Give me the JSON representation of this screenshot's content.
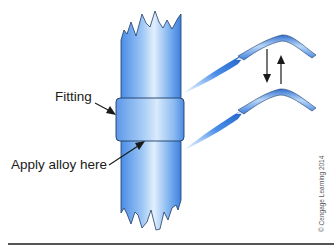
{
  "figure": {
    "labels": {
      "fitting": "Fitting",
      "apply_alloy": "Apply alloy here"
    },
    "credit": "© Cengage Learning 2014",
    "colors": {
      "pipe_light": "#d6e8fb",
      "pipe_mid": "#7fb3f0",
      "pipe_dark": "#3d80de",
      "outline": "#1f3c66",
      "arrow": "#1a1a1a",
      "rule": "#555555"
    },
    "torch_motion": "up-and-down"
  }
}
